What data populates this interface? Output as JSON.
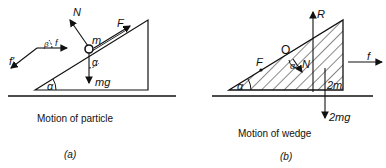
{
  "figure_a": {
    "caption": "Motion of particle",
    "sublabel": "(a)",
    "labels": {
      "normal": "N",
      "friction_up": "F",
      "mass": "m",
      "angle_at_mass": "α",
      "weight": "mg",
      "base_angle": "α",
      "f": "f",
      "f_prime": "f'",
      "beta": "β"
    }
  },
  "figure_b": {
    "caption": "Motion of wedge",
    "sublabel": "(b)",
    "labels": {
      "reaction": "R",
      "origin": "O",
      "friction": "F",
      "angle_at_n": "α",
      "normal": "N",
      "external_force": "f",
      "wedge_mass": "2m",
      "weight": "2mg",
      "base_angle": "α"
    }
  }
}
